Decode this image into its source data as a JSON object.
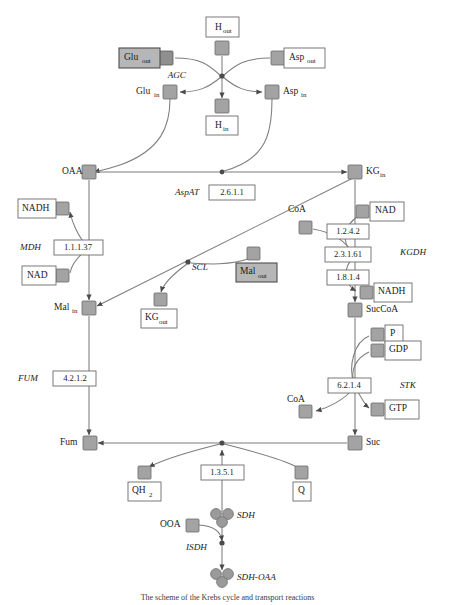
{
  "figure": {
    "caption": "The scheme of the Krebs cycle and transport reactions",
    "colors": {
      "node_fill": "#a3a3a3",
      "node_stroke": "#6a6a6a",
      "edge": "#7d7d7d",
      "junction": "#4a4a4a",
      "box_open_fill": "#ffffff",
      "box_filled_fill": "#b6b6b6",
      "text": "#1a1a1a"
    }
  },
  "metabolites": {
    "h_out": {
      "label": "H",
      "sub": "out",
      "boxed": "open",
      "x": 222,
      "y": 28,
      "node_x": 222,
      "node_y": 48
    },
    "glu_out": {
      "label": "Glu",
      "sub": "out",
      "boxed": "filled",
      "x": 140,
      "y": 58,
      "node_x": 166,
      "node_y": 58
    },
    "asp_out": {
      "label": "Asp",
      "sub": "out",
      "boxed": "open",
      "x": 303,
      "y": 58,
      "node_x": 278,
      "node_y": 58
    },
    "glu_in": {
      "label": "Glu",
      "sub": "in",
      "boxed": "none",
      "x": 148,
      "y": 92,
      "node_x": 170,
      "node_y": 92
    },
    "asp_in": {
      "label": "Asp",
      "sub": "in",
      "boxed": "none",
      "x": 285,
      "y": 92,
      "node_x": 272,
      "node_y": 92
    },
    "h_in": {
      "label": "H",
      "sub": "in",
      "boxed": "open",
      "x": 222,
      "y": 125,
      "node_x": 222,
      "node_y": 106
    },
    "oaa": {
      "label": "OAA",
      "sub": "",
      "boxed": "none",
      "x": 70,
      "y": 172,
      "node_x": 89,
      "node_y": 172
    },
    "kg_in": {
      "label": "KG",
      "sub": "in",
      "boxed": "none",
      "x": 368,
      "y": 172,
      "node_x": 355,
      "node_y": 172
    },
    "nadh_l": {
      "label": "NADH",
      "sub": "",
      "boxed": "open",
      "x": 33,
      "y": 209,
      "node_x": 62,
      "node_y": 209
    },
    "nad_l": {
      "label": "NAD",
      "sub": "",
      "boxed": "open",
      "x": 33,
      "y": 276,
      "node_x": 62,
      "node_y": 276
    },
    "mal_in": {
      "label": "Mal",
      "sub": "in",
      "boxed": "none",
      "x": 66,
      "y": 308,
      "node_x": 89,
      "node_y": 308
    },
    "mal_out": {
      "label": "Mal",
      "sub": "out",
      "boxed": "filled",
      "x": 260,
      "y": 272,
      "node_x": 253,
      "node_y": 254
    },
    "kg_out": {
      "label": "KG",
      "sub": "out",
      "boxed": "open",
      "x": 160,
      "y": 318,
      "node_x": 160,
      "node_y": 300
    },
    "coa_top": {
      "label": "CoA",
      "sub": "",
      "boxed": "none",
      "x": 300,
      "y": 210,
      "node_x": 305,
      "node_y": 227
    },
    "nad_r": {
      "label": "NAD",
      "sub": "",
      "boxed": "open",
      "x": 382,
      "y": 211,
      "node_x": 362,
      "node_y": 211
    },
    "nadh_r": {
      "label": "NADH",
      "sub": "",
      "boxed": "open",
      "x": 388,
      "y": 292,
      "node_x": 366,
      "node_y": 292
    },
    "succoa": {
      "label": "SucCoA",
      "sub": "",
      "boxed": "none",
      "x": 366,
      "y": 310,
      "node_x": 355,
      "node_y": 310
    },
    "p_r": {
      "label": "P",
      "sub": "",
      "boxed": "open",
      "x": 392,
      "y": 334,
      "node_x": 377,
      "node_y": 334
    },
    "gdp_r": {
      "label": "GDP",
      "sub": "",
      "boxed": "open",
      "x": 398,
      "y": 350,
      "node_x": 377,
      "node_y": 350
    },
    "coa_bot": {
      "label": "CoA",
      "sub": "",
      "boxed": "none",
      "x": 299,
      "y": 400,
      "node_x": 305,
      "node_y": 411
    },
    "gtp_r": {
      "label": "GTP",
      "sub": "",
      "boxed": "open",
      "x": 398,
      "y": 409,
      "node_x": 377,
      "node_y": 409
    },
    "fum": {
      "label": "Fum",
      "sub": "",
      "boxed": "none",
      "x": 68,
      "y": 443,
      "node_x": 90,
      "node_y": 443
    },
    "suc": {
      "label": "Suc",
      "sub": "",
      "boxed": "none",
      "x": 368,
      "y": 443,
      "node_x": 355,
      "node_y": 443
    },
    "qh2": {
      "label": "QH",
      "sub": "2",
      "boxed": "open",
      "x": 144,
      "y": 491,
      "node_x": 144,
      "node_y": 473
    },
    "q": {
      "label": "Q",
      "sub": "",
      "boxed": "open",
      "x": 301,
      "y": 491,
      "node_x": 301,
      "node_y": 473
    },
    "ooa": {
      "label": "OOA",
      "sub": "",
      "boxed": "none",
      "x": 172,
      "y": 525,
      "node_x": 192,
      "node_y": 525
    }
  },
  "complexes": {
    "sdh": {
      "label": "SDH",
      "x": 243,
      "y": 518,
      "cx": 222,
      "cy": 518
    },
    "sdh_oaa": {
      "label": "SDH-OAA",
      "x": 243,
      "y": 578,
      "cx": 222,
      "cy": 578
    }
  },
  "enzymes": [
    {
      "name": "AGC",
      "x": 196,
      "y": 76,
      "anchor": "end"
    },
    {
      "name": "AspAT",
      "x": 175,
      "y": 193,
      "anchor": "start"
    },
    {
      "name": "MDH",
      "x": 20,
      "y": 248,
      "anchor": "start"
    },
    {
      "name": "SCL",
      "x": 190,
      "y": 266,
      "anchor": "start"
    },
    {
      "name": "KGDH",
      "x": 393,
      "y": 253,
      "anchor": "start"
    },
    {
      "name": "FUM",
      "x": 18,
      "y": 379,
      "anchor": "start"
    },
    {
      "name": "STK",
      "x": 393,
      "y": 386,
      "anchor": "start"
    },
    {
      "name": "SDH",
      "x": 243,
      "y": 518,
      "anchor": "start"
    },
    {
      "name": "ISDH",
      "x": 186,
      "y": 548,
      "anchor": "start"
    },
    {
      "name": "SDH-OAA",
      "x": 243,
      "y": 578,
      "anchor": "start"
    }
  ],
  "ec_numbers": [
    {
      "code": "2.6.1.1",
      "x": 232,
      "y": 193,
      "w": 46,
      "h": 15
    },
    {
      "code": "1.1.1.37",
      "x": 78,
      "y": 248,
      "w": 49,
      "h": 15
    },
    {
      "code": "1.2.4.2",
      "x": 348,
      "y": 232,
      "w": 42,
      "h": 15
    },
    {
      "code": "2.3.1.61",
      "x": 348,
      "y": 255,
      "w": 46,
      "h": 15
    },
    {
      "code": "1.8.1.4",
      "x": 348,
      "y": 278,
      "w": 42,
      "h": 15
    },
    {
      "code": "4.2.1.2",
      "x": 75,
      "y": 379,
      "w": 43,
      "h": 15
    },
    {
      "code": "6.2.1.4",
      "x": 349,
      "y": 386,
      "w": 43,
      "h": 15
    },
    {
      "code": "1.3.5.1",
      "x": 222,
      "y": 473,
      "w": 43,
      "h": 15
    }
  ],
  "legend_note": {
    "filled_boxes_meaning": "shaded nodes",
    "open_boxes_meaning": "outlined nodes"
  }
}
